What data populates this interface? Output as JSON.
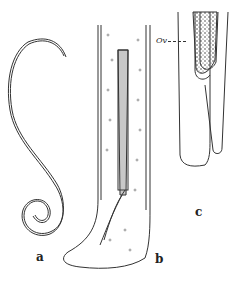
{
  "figure": {
    "panels": [
      {
        "id": "a",
        "label": "a",
        "description": "coiled thread-like worm"
      },
      {
        "id": "b",
        "label": "b",
        "description": "tail end with spicule"
      },
      {
        "id": "c",
        "label": "c",
        "description": "bifurcated end with ovary"
      }
    ],
    "annotations": [
      {
        "text": "Ov",
        "panel": "c"
      }
    ],
    "colors": {
      "ink": "#222222",
      "paper": "#ffffff"
    }
  }
}
